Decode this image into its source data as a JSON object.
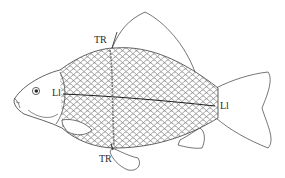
{
  "diagram": {
    "labels": {
      "tr_top": "TR",
      "tr_bottom": "TR",
      "ll_left": "Ll",
      "ll_right": "Ll"
    },
    "colors": {
      "stroke": "#3a3a3a",
      "scale_pattern": "#555555",
      "background": "#ffffff"
    }
  }
}
